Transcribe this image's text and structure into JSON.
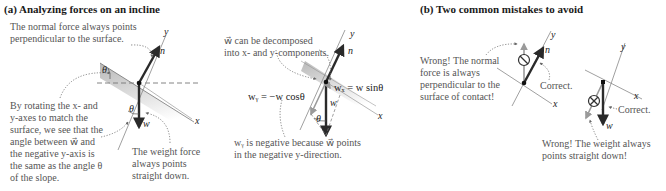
{
  "panel_a": {
    "title": "(a) Analyzing forces on an incline",
    "notes": {
      "normal_force": [
        "The normal force always points",
        "perpendicular to the surface."
      ],
      "rotating_axes": [
        "By rotating the x- and",
        "y-axes to match the",
        "surface, we see that the",
        "angle between w⃗ and",
        "the negative y-axis is",
        "the same as the angle θ",
        "of the slope."
      ],
      "weight_down": [
        "The weight force",
        "always points",
        "straight down."
      ],
      "decompose": [
        "w⃗ can be decomposed",
        "into x- and y-components."
      ],
      "wy_negative": [
        "wᵧ is negative because w⃗ points",
        "in the negative y-direction."
      ]
    },
    "labels": {
      "y_axis": "y",
      "x_axis": "x",
      "normal_vector": "n⃗",
      "weight_vector": "w⃗",
      "theta": "θ"
    },
    "equations": {
      "wx": "wₓ = w sinθ",
      "wy": "wᵧ = −w cosθ"
    }
  },
  "panel_b": {
    "title": "(b) Two common mistakes to avoid",
    "notes": {
      "wrong_normal": [
        "Wrong! The normal",
        "force is always",
        "perpendicular to the",
        "surface of contact!"
      ],
      "correct_normal": "Correct.",
      "correct_weight": "Correct.",
      "wrong_weight": [
        "Wrong! The weight always",
        "points straight down!"
      ]
    },
    "labels": {
      "y_axis": "y",
      "x_axis": "x",
      "normal_vector": "n⃗",
      "weight_vector": "w⃗"
    }
  },
  "colors": {
    "text_dark": "#1a1a1a",
    "note_gray": "#555555",
    "vector_dark": "#2a2a2a",
    "wrong_vector": "#9a9a9a",
    "surface_shade": "#c8c8c8",
    "dotted_leader": "#666666"
  }
}
